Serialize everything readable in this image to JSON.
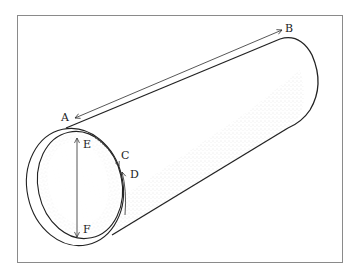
{
  "figure": {
    "labels": {
      "A": "A",
      "B": "B",
      "C": "C",
      "D": "D",
      "E": "E",
      "F": "F"
    },
    "colors": {
      "frame": "#8a8a8a",
      "ink": "#222222",
      "stipple": "#9a9a9a"
    }
  }
}
